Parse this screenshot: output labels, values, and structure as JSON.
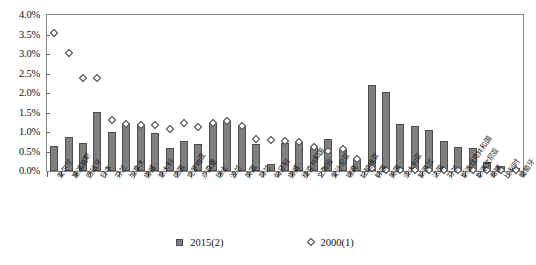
{
  "chart_data": {
    "type": "bar",
    "title": "",
    "subtitle": "",
    "xlabel": "",
    "ylabel": "",
    "ylim": [
      0,
      4.0
    ],
    "ytick_step": 0.5,
    "ytick_labels": [
      "0.0%",
      "0.5%",
      "1.0%",
      "1.5%",
      "2.0%",
      "2.5%",
      "3.0%",
      "3.5%",
      "4.0%"
    ],
    "ytick_values": [
      0.0,
      0.5,
      1.0,
      1.5,
      2.0,
      2.5,
      3.0,
      3.5,
      4.0
    ],
    "grid": false,
    "legend_position": "bottom",
    "categories": [
      "爱尔兰",
      "塞浦路斯",
      "西班牙",
      "日本",
      "芬兰",
      "加拿大",
      "挪威",
      "意大利",
      "德国",
      "克罗地亚",
      "卢森堡",
      "瑞士",
      "波兰",
      "英国",
      "荷兰",
      "匈牙利",
      "挪威",
      "捷克共和国",
      "立陶宛",
      "爱沙尼亚",
      "瑞典",
      "拉脱维亚",
      "韩国",
      "美国",
      "澳大利亚",
      "新西兰",
      "法国",
      "芬兰",
      "斯洛伐克共和国",
      "斯洛文尼亚",
      "希腊",
      "比利时",
      "葡萄牙"
    ],
    "series": [
      {
        "name": "2015(2)",
        "marker": "bar",
        "color": "#808080",
        "values": [
          0.65,
          0.87,
          0.72,
          1.51,
          0.99,
          1.24,
          1.18,
          0.98,
          0.58,
          0.78,
          0.68,
          1.24,
          1.27,
          1.15,
          0.7,
          0.18,
          0.72,
          0.74,
          0.62,
          0.82,
          0.56,
          0.32,
          2.2,
          2.02,
          1.2,
          1.15,
          1.05,
          0.78,
          0.62,
          0.59,
          0.22,
          0.13,
          0.08
        ]
      },
      {
        "name": "2000(1)",
        "marker": "diamond",
        "color": "#ffffff",
        "values": [
          3.53,
          3.03,
          2.39,
          2.38,
          1.3,
          1.2,
          1.17,
          1.17,
          1.09,
          1.23,
          1.12,
          1.24,
          1.27,
          1.15,
          0.82,
          0.8,
          0.78,
          0.74,
          0.62,
          0.51,
          0.56,
          0.32,
          0.07,
          0.03,
          0.03,
          0.03,
          0.03,
          0.03,
          0.03,
          0.03,
          0.03,
          0.03,
          0.03
        ]
      }
    ]
  },
  "legend": {
    "items": [
      {
        "label": "2015(2)",
        "type": "bar"
      },
      {
        "label": "2000(1)",
        "type": "diamond"
      }
    ]
  }
}
